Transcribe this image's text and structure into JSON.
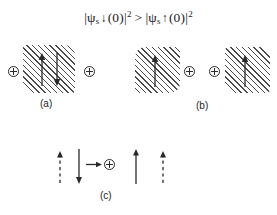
{
  "figure": {
    "width": 277,
    "height": 215,
    "background": "#ffffff",
    "ink_color": "#2a2a2a",
    "hatch_color": "#4a4a4a"
  },
  "formula": {
    "full_text": "|ψs↓(0)|² > |ψs↑(0)|²",
    "left": {
      "bar_open": "|",
      "psi": "ψ",
      "subscript": "s",
      "spin": "↓",
      "argument": "(0)",
      "bar_close": "|",
      "exponent": "2"
    },
    "relation": ">",
    "right": {
      "bar_open": "|",
      "psi": "ψ",
      "subscript": "s",
      "spin": "↑",
      "argument": "(0)",
      "bar_close": "|",
      "exponent": "2"
    }
  },
  "panels": [
    {
      "id": "a",
      "label": "(a)",
      "charges": [
        "⊕",
        "⊕"
      ],
      "charge_count": 2,
      "arrows": [
        {
          "direction": "up",
          "style": "solid"
        },
        {
          "direction": "down",
          "style": "solid"
        }
      ],
      "hatched_region": true
    },
    {
      "id": "b",
      "label": "(b)",
      "charges": [
        "⊕",
        "⊕"
      ],
      "charge_count": 2,
      "arrows": [
        {
          "direction": "up",
          "style": "solid"
        },
        {
          "direction": "up",
          "style": "solid"
        }
      ],
      "hatched_region": true
    },
    {
      "id": "c",
      "label": "(c)",
      "charges": [
        "⊕"
      ],
      "charge_count": 1,
      "arrows": [
        {
          "direction": "up",
          "style": "dashed"
        },
        {
          "direction": "down",
          "style": "solid"
        },
        {
          "direction": "right",
          "style": "solid"
        },
        {
          "direction": "up",
          "style": "solid"
        },
        {
          "direction": "up",
          "style": "dashed"
        }
      ],
      "hatched_region": false
    }
  ]
}
